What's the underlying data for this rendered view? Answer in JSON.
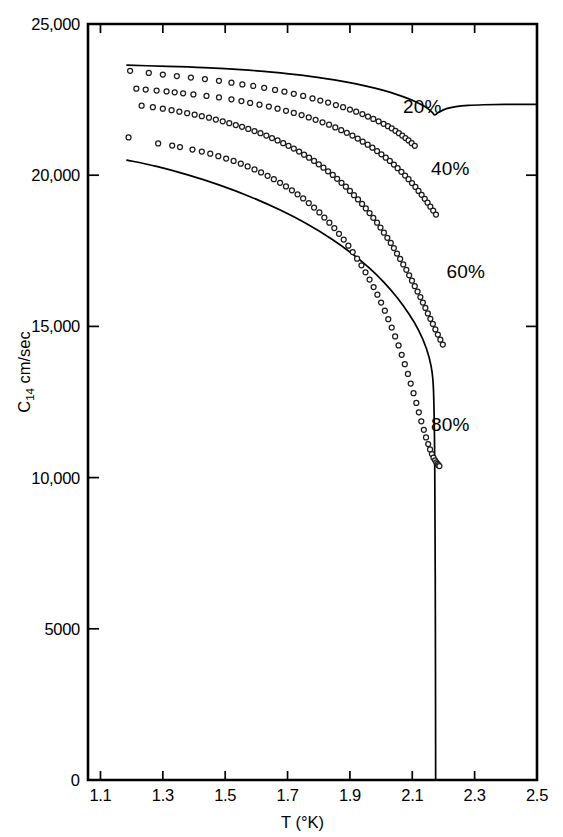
{
  "chart_data": {
    "type": "scatter",
    "title": "",
    "xlabel": "T (°K)",
    "ylabel": "C₁₄ cm/sec",
    "ylabel_main": "C",
    "ylabel_sub": "14",
    "ylabel_rest": " cm/sec",
    "xlim": [
      1.06,
      2.5
    ],
    "ylim": [
      0,
      25000
    ],
    "grid": false,
    "legend_position": "inline-right-of-curves",
    "x_ticks": [
      {
        "value": 1.1,
        "label": "1.1"
      },
      {
        "value": 1.3,
        "label": "1.3"
      },
      {
        "value": 1.5,
        "label": "1.5"
      },
      {
        "value": 1.7,
        "label": "1.7"
      },
      {
        "value": 1.9,
        "label": "1.9"
      },
      {
        "value": 2.1,
        "label": "2.1"
      },
      {
        "value": 2.3,
        "label": "2.3"
      },
      {
        "value": 2.5,
        "label": "2.5"
      }
    ],
    "y_ticks": [
      {
        "value": 0,
        "label": "0"
      },
      {
        "value": 5000,
        "label": "5000"
      },
      {
        "value": 10000,
        "label": "10,000"
      },
      {
        "value": 15000,
        "label": "15,000"
      },
      {
        "value": 20000,
        "label": "20,000"
      },
      {
        "value": 25000,
        "label": "25,000"
      }
    ],
    "annotations": [
      {
        "text": "20%",
        "x": 2.07,
        "y": 22050
      },
      {
        "text": "40%",
        "x": 2.16,
        "y": 20000
      },
      {
        "text": "60%",
        "x": 2.21,
        "y": 16600
      },
      {
        "text": "80%",
        "x": 2.16,
        "y": 11550
      }
    ],
    "series": [
      {
        "name": "20%",
        "marker": "open-circle",
        "x": [
          1.195,
          1.255,
          1.3,
          1.345,
          1.39,
          1.435,
          1.48,
          1.52,
          1.555,
          1.59,
          1.625,
          1.66,
          1.69,
          1.72,
          1.75,
          1.78,
          1.805,
          1.83,
          1.855,
          1.878,
          1.9,
          1.92,
          1.94,
          1.958,
          1.975,
          1.992,
          2.008,
          2.022,
          2.034,
          2.046,
          2.057,
          2.068,
          2.078,
          2.088,
          2.098,
          2.108
        ],
        "y": [
          23450,
          23380,
          23330,
          23280,
          23230,
          23180,
          23120,
          23060,
          23000,
          22950,
          22890,
          22820,
          22760,
          22690,
          22620,
          22540,
          22470,
          22400,
          22320,
          22250,
          22170,
          22100,
          22020,
          21940,
          21860,
          21780,
          21700,
          21620,
          21550,
          21470,
          21390,
          21310,
          21230,
          21150,
          21060,
          20970
        ]
      },
      {
        "name": "40%",
        "marker": "open-circle",
        "x": [
          1.215,
          1.245,
          1.28,
          1.312,
          1.338,
          1.365,
          1.398,
          1.44,
          1.48,
          1.52,
          1.552,
          1.58,
          1.61,
          1.64,
          1.668,
          1.695,
          1.72,
          1.745,
          1.768,
          1.79,
          1.812,
          1.833,
          1.853,
          1.872,
          1.89,
          1.908,
          1.925,
          1.941,
          1.957,
          1.972,
          1.987,
          2.001,
          2.015,
          2.028,
          2.041,
          2.053,
          2.065,
          2.077,
          2.088,
          2.099,
          2.11,
          2.12,
          2.13,
          2.14,
          2.149,
          2.158,
          2.167,
          2.176
        ],
        "y": [
          22860,
          22830,
          22800,
          22770,
          22740,
          22710,
          22670,
          22620,
          22570,
          22510,
          22450,
          22390,
          22330,
          22270,
          22200,
          22130,
          22060,
          21990,
          21910,
          21830,
          21750,
          21670,
          21580,
          21490,
          21400,
          21310,
          21210,
          21110,
          21010,
          20910,
          20800,
          20690,
          20580,
          20470,
          20350,
          20230,
          20110,
          19990,
          19870,
          19740,
          19610,
          19480,
          19350,
          19220,
          19090,
          18960,
          18830,
          18700
        ]
      },
      {
        "name": "60%",
        "marker": "open-circle",
        "x": [
          1.232,
          1.268,
          1.3,
          1.328,
          1.353,
          1.378,
          1.402,
          1.425,
          1.448,
          1.47,
          1.492,
          1.513,
          1.534,
          1.554,
          1.574,
          1.594,
          1.613,
          1.632,
          1.65,
          1.668,
          1.686,
          1.703,
          1.72,
          1.737,
          1.753,
          1.769,
          1.785,
          1.8,
          1.815,
          1.83,
          1.845,
          1.859,
          1.873,
          1.887,
          1.9,
          1.913,
          1.926,
          1.939,
          1.951,
          1.963,
          1.975,
          1.987,
          1.998,
          2.009,
          2.02,
          2.031,
          2.041,
          2.051,
          2.061,
          2.071,
          2.081,
          2.09,
          2.099,
          2.108,
          2.117,
          2.126,
          2.134,
          2.142,
          2.15,
          2.158,
          2.166,
          2.174,
          2.182,
          2.19,
          2.198
        ],
        "y": [
          22300,
          22250,
          22200,
          22150,
          22100,
          22050,
          22000,
          21950,
          21900,
          21840,
          21780,
          21720,
          21660,
          21600,
          21530,
          21460,
          21390,
          21310,
          21230,
          21150,
          21060,
          20970,
          20880,
          20780,
          20680,
          20580,
          20470,
          20360,
          20250,
          20130,
          20010,
          19880,
          19750,
          19620,
          19480,
          19340,
          19200,
          19050,
          18900,
          18750,
          18590,
          18430,
          18270,
          18100,
          17930,
          17760,
          17590,
          17410,
          17230,
          17050,
          16870,
          16690,
          16510,
          16330,
          16150,
          15970,
          15790,
          15610,
          15430,
          15250,
          15080,
          14900,
          14730,
          14560,
          14400
        ]
      },
      {
        "name": "80%",
        "marker": "open-circle",
        "x": [
          1.19,
          1.285,
          1.33,
          1.355,
          1.395,
          1.425,
          1.452,
          1.478,
          1.503,
          1.527,
          1.55,
          1.572,
          1.594,
          1.615,
          1.636,
          1.656,
          1.676,
          1.695,
          1.714,
          1.732,
          1.75,
          1.768,
          1.785,
          1.802,
          1.818,
          1.834,
          1.85,
          1.865,
          1.88,
          1.895,
          1.909,
          1.923,
          1.937,
          1.95,
          1.963,
          1.976,
          1.988,
          2.0,
          2.012,
          2.023,
          2.034,
          2.045,
          2.056,
          2.066,
          2.076,
          2.086,
          2.095,
          2.104,
          2.113,
          2.121,
          2.129,
          2.137,
          2.144,
          2.151,
          2.157,
          2.163,
          2.168,
          2.173,
          2.177,
          2.181,
          2.184,
          2.187
        ],
        "y": [
          21250,
          21050,
          20980,
          20930,
          20850,
          20780,
          20710,
          20630,
          20550,
          20470,
          20380,
          20290,
          20190,
          20090,
          19980,
          19870,
          19750,
          19630,
          19500,
          19370,
          19230,
          19080,
          18930,
          18770,
          18600,
          18430,
          18250,
          18060,
          17870,
          17670,
          17460,
          17240,
          17020,
          16790,
          16550,
          16300,
          16050,
          15790,
          15520,
          15240,
          14960,
          14670,
          14370,
          14060,
          13750,
          13430,
          13110,
          12790,
          12470,
          12160,
          11860,
          11580,
          11330,
          11110,
          10930,
          10780,
          10660,
          10570,
          10500,
          10450,
          10410,
          10380
        ]
      }
    ],
    "solid_curves": [
      {
        "name": "upper-theory-curve",
        "x": [
          1.185,
          1.25,
          1.35,
          1.45,
          1.55,
          1.65,
          1.75,
          1.85,
          1.92,
          1.98,
          2.03,
          2.07,
          2.1,
          2.13,
          2.15,
          2.165,
          2.172,
          2.185,
          2.21,
          2.24,
          2.28,
          2.33,
          2.4,
          2.5
        ],
        "y": [
          23640,
          23620,
          23590,
          23550,
          23490,
          23410,
          23300,
          23150,
          23020,
          22880,
          22740,
          22600,
          22480,
          22330,
          22200,
          22070,
          21990,
          22080,
          22200,
          22270,
          22310,
          22330,
          22340,
          22340
        ]
      },
      {
        "name": "lower-theory-curve",
        "x": [
          1.185,
          1.28,
          1.38,
          1.48,
          1.58,
          1.68,
          1.76,
          1.84,
          1.9,
          1.96,
          2.01,
          2.05,
          2.09,
          2.12,
          2.145,
          2.16,
          2.168,
          2.172,
          2.174,
          2.175
        ],
        "y": [
          20500,
          20290,
          20010,
          19680,
          19290,
          18830,
          18400,
          17900,
          17460,
          16950,
          16450,
          15970,
          15400,
          14880,
          14280,
          13700,
          12900,
          10500,
          5500,
          0
        ]
      }
    ]
  },
  "geometry": {
    "plot_left": 88,
    "plot_right": 537,
    "plot_top": 24,
    "plot_bottom": 780
  }
}
